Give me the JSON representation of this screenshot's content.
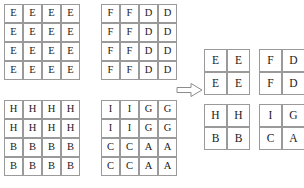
{
  "diagram": {
    "arrow": {
      "name": "transform-arrow",
      "direction": "right",
      "glyph": "⇒"
    },
    "source_grids": [
      {
        "id": "grid-a",
        "label": "source-grid-e",
        "rows": 4,
        "cols": 4,
        "cells": [
          [
            "E",
            "E",
            "E",
            "E"
          ],
          [
            "E",
            "E",
            "E",
            "E"
          ],
          [
            "E",
            "E",
            "E",
            "E"
          ],
          [
            "E",
            "E",
            "E",
            "E"
          ]
        ]
      },
      {
        "id": "grid-b",
        "label": "source-grid-fd",
        "rows": 4,
        "cols": 4,
        "cells": [
          [
            "F",
            "F",
            "D",
            "D"
          ],
          [
            "F",
            "F",
            "D",
            "D"
          ],
          [
            "F",
            "F",
            "D",
            "D"
          ],
          [
            "F",
            "F",
            "D",
            "D"
          ]
        ]
      },
      {
        "id": "grid-c",
        "label": "source-grid-hb",
        "rows": 4,
        "cols": 4,
        "cells": [
          [
            "H",
            "H",
            "H",
            "H"
          ],
          [
            "H",
            "H",
            "H",
            "H"
          ],
          [
            "B",
            "B",
            "B",
            "B"
          ],
          [
            "B",
            "B",
            "B",
            "B"
          ]
        ]
      },
      {
        "id": "grid-d",
        "label": "source-grid-igca",
        "rows": 4,
        "cols": 4,
        "cells": [
          [
            "I",
            "I",
            "G",
            "G"
          ],
          [
            "I",
            "I",
            "G",
            "G"
          ],
          [
            "C",
            "C",
            "A",
            "A"
          ],
          [
            "C",
            "C",
            "A",
            "A"
          ]
        ]
      }
    ],
    "result_grids": [
      {
        "id": "grid-ra",
        "label": "result-grid-e",
        "rows": 2,
        "cols": 2,
        "cells": [
          [
            "E",
            "E"
          ],
          [
            "E",
            "E"
          ]
        ]
      },
      {
        "id": "grid-rb",
        "label": "result-grid-fd",
        "rows": 2,
        "cols": 2,
        "cells": [
          [
            "F",
            "D"
          ],
          [
            "F",
            "D"
          ]
        ]
      },
      {
        "id": "grid-rc",
        "label": "result-grid-hb",
        "rows": 2,
        "cols": 2,
        "cells": [
          [
            "H",
            "H"
          ],
          [
            "B",
            "B"
          ]
        ]
      },
      {
        "id": "grid-rd",
        "label": "result-grid-igca",
        "rows": 2,
        "cols": 2,
        "cells": [
          [
            "I",
            "G"
          ],
          [
            "C",
            "A"
          ]
        ]
      }
    ],
    "colors": {
      "cell_border": "#9a9a9a",
      "cell_background": "#ffffff",
      "text": "#1a1a1a",
      "arrow_stroke": "#8c8c8c",
      "page_background": "#ffffff"
    }
  }
}
